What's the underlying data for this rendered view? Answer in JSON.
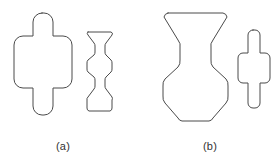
{
  "figure": {
    "background_color": "#ffffff",
    "stroke_color": "#4a4a4a",
    "fill_color": "#ffffff",
    "width": 280,
    "height": 166,
    "panels": [
      {
        "id": "a",
        "caption": "(a)",
        "shapes": [
          {
            "name": "rounded-rect-with-caps-large",
            "role": "primary",
            "description": "large rounded square body with rounded-cap stems protruding top and bottom",
            "body": {
              "x": 14,
              "y": 36,
              "width": 58,
              "height": 52,
              "corner_radius": 9
            },
            "stem": {
              "x": 33,
              "width": 20,
              "top_y": 13,
              "bottom_y": 115,
              "cap_radius": 9
            }
          },
          {
            "name": "wavy-spool-small",
            "role": "secondary",
            "description": "small stacked hourglass / spool outline with three concave waists",
            "bounds": {
              "x": 86,
              "y": 30,
              "width": 27,
              "height": 83
            }
          }
        ]
      },
      {
        "id": "b",
        "caption": "(b)",
        "shapes": [
          {
            "name": "wavy-spool-large",
            "role": "primary",
            "description": "large stacked hourglass / spool outline with three concave waists",
            "bounds": {
              "x": 163,
              "y": 13,
              "width": 65,
              "height": 112
            }
          },
          {
            "name": "rounded-rect-with-caps-small",
            "role": "secondary",
            "description": "small rounded square body with rounded-cap stems protruding top and bottom",
            "body": {
              "x": 238,
              "y": 53,
              "width": 32,
              "height": 30,
              "corner_radius": 5
            },
            "stem": {
              "x": 248,
              "width": 12,
              "top_y": 30,
              "bottom_y": 108,
              "cap_radius": 5
            }
          }
        ]
      }
    ]
  }
}
